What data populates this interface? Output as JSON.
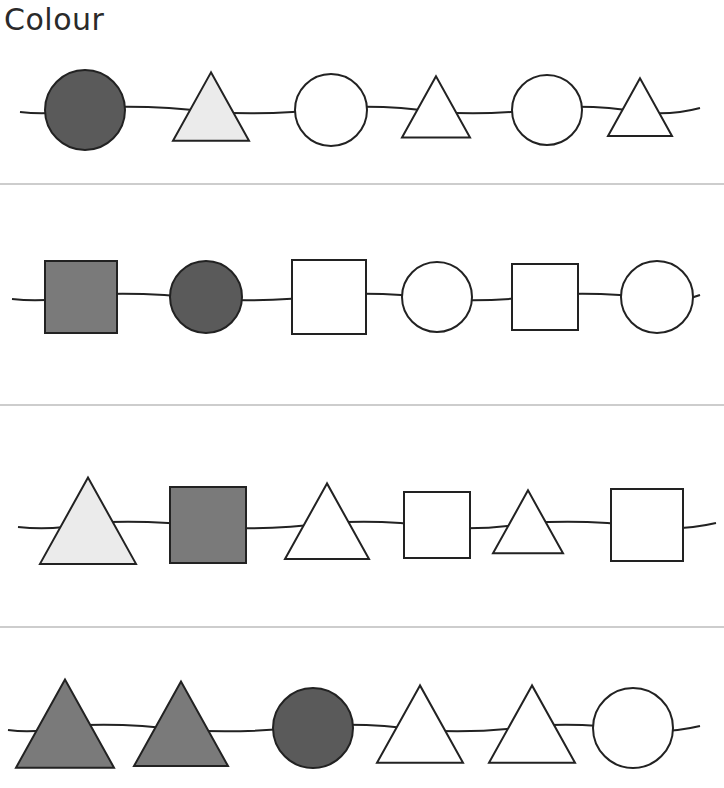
{
  "title": "Colour",
  "colors": {
    "dark": "#5a5a5a",
    "medium": "#7a7a7a",
    "light": "#ebebeb",
    "empty": "#ffffff",
    "stroke": "#222222",
    "divider": "#bdbdbd"
  },
  "rows": [
    {
      "shapes": [
        {
          "type": "circle",
          "fill": "dark"
        },
        {
          "type": "triangle",
          "fill": "light"
        },
        {
          "type": "circle",
          "fill": "empty"
        },
        {
          "type": "triangle",
          "fill": "empty"
        },
        {
          "type": "circle",
          "fill": "empty"
        },
        {
          "type": "triangle",
          "fill": "empty"
        }
      ]
    },
    {
      "shapes": [
        {
          "type": "square",
          "fill": "medium"
        },
        {
          "type": "circle",
          "fill": "dark"
        },
        {
          "type": "square",
          "fill": "empty"
        },
        {
          "type": "circle",
          "fill": "empty"
        },
        {
          "type": "square",
          "fill": "empty"
        },
        {
          "type": "circle",
          "fill": "empty"
        }
      ]
    },
    {
      "shapes": [
        {
          "type": "triangle",
          "fill": "light"
        },
        {
          "type": "square",
          "fill": "medium"
        },
        {
          "type": "triangle",
          "fill": "empty"
        },
        {
          "type": "square",
          "fill": "empty"
        },
        {
          "type": "triangle",
          "fill": "empty"
        },
        {
          "type": "square",
          "fill": "empty"
        }
      ]
    },
    {
      "shapes": [
        {
          "type": "triangle",
          "fill": "medium"
        },
        {
          "type": "triangle",
          "fill": "medium"
        },
        {
          "type": "circle",
          "fill": "dark"
        },
        {
          "type": "triangle",
          "fill": "empty"
        },
        {
          "type": "triangle",
          "fill": "empty"
        },
        {
          "type": "circle",
          "fill": "empty"
        }
      ]
    }
  ]
}
